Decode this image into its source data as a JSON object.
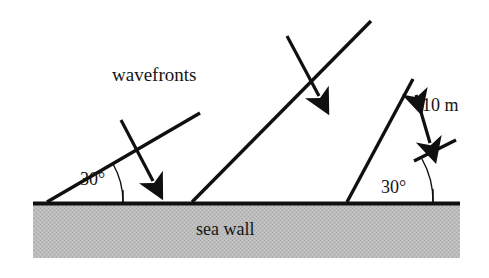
{
  "figure": {
    "labels": {
      "wavefronts": "wavefronts",
      "sea_wall": "sea wall",
      "spacing": "10 m",
      "angle_left": "30°",
      "angle_right": "30°"
    },
    "colors": {
      "line": "#101010",
      "wall_fill": "#b9b9b9",
      "wall_edge": "#101010",
      "background": "#ffffff",
      "text": "#151515"
    },
    "geometry": {
      "incidence_angle_degrees": 30,
      "wavefront_spacing_label": "10 m",
      "wall_top_y": 202,
      "wall_left_x": 33,
      "wall_right_x": 460,
      "wall_bottom_y": 258,
      "wavefronts": [
        {
          "name": "wavefront-1",
          "x1": 47,
          "y1": 202,
          "x2": 200,
          "y2": 113
        },
        {
          "name": "wavefront-2",
          "x1": 192,
          "y1": 202,
          "x2": 370,
          "y2": 22
        },
        {
          "name": "wavefront-3",
          "x1": 347,
          "y1": 202,
          "x2": 412,
          "y2": 80
        },
        {
          "name": "wavefront-4",
          "x1": 415,
          "y1": 160,
          "x2": 455,
          "y2": 141
        }
      ],
      "propagation_arrows": [
        {
          "name": "propagation-arrow-left",
          "x1": 121,
          "y1": 121,
          "x2": 156,
          "y2": 186
        },
        {
          "name": "propagation-arrow-right",
          "x1": 287,
          "y1": 37,
          "x2": 322,
          "y2": 100
        }
      ],
      "spacing_arrow": {
        "x1": 411,
        "y1": 84,
        "x2": 433,
        "y2": 150
      }
    }
  }
}
